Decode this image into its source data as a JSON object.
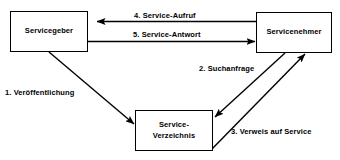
{
  "diagram": {
    "background_color": "#ffffff",
    "line_color": "#000000",
    "text_color": "#000000",
    "nodes": [
      {
        "id": "provider",
        "label": "Servicegeber"
      },
      {
        "id": "consumer",
        "label": "Servicenehmer"
      },
      {
        "id": "registry",
        "label": "Service-\nVerzeichnis"
      }
    ],
    "edges": [
      {
        "id": "edge-1",
        "number": "1.",
        "label": "1. Veröffentlichung",
        "from": "provider",
        "to": "registry",
        "direction": "down-right"
      },
      {
        "id": "edge-2",
        "number": "2.",
        "label": "2. Suchanfrage",
        "from": "consumer",
        "to": "registry",
        "direction": "down-left"
      },
      {
        "id": "edge-3",
        "number": "3.",
        "label": "3. Verweis auf Service",
        "from": "registry",
        "to": "consumer",
        "direction": "up-right"
      },
      {
        "id": "edge-4",
        "number": "4.",
        "label": "4. Service-Aufruf",
        "from": "consumer",
        "to": "provider",
        "direction": "left"
      },
      {
        "id": "edge-5",
        "number": "5.",
        "label": "5. Service-Antwort",
        "from": "provider",
        "to": "consumer",
        "direction": "right"
      }
    ]
  }
}
